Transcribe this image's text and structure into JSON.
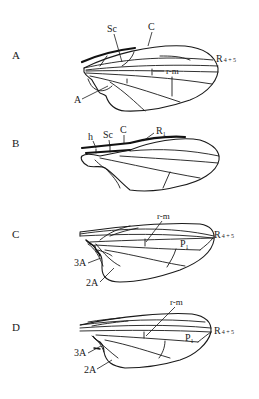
{
  "figure": {
    "panels": [
      {
        "id": "A",
        "letter": "A",
        "labels": {
          "sc": "Sc",
          "c": "C",
          "r45_main": "R",
          "r45_sub": "4 + 5",
          "rm": "r-m",
          "a": "A"
        }
      },
      {
        "id": "B",
        "letter": "B",
        "labels": {
          "h": "h",
          "sc": "Sc",
          "c": "C",
          "r1_main": "R",
          "r1_sub": "1"
        }
      },
      {
        "id": "C",
        "letter": "C",
        "labels": {
          "rm": "r-m",
          "r45_main": "R",
          "r45_sub": "4 + 5",
          "p1_main": "P",
          "p1_sub": "1",
          "a3": "3A",
          "a2": "2A"
        }
      },
      {
        "id": "D",
        "letter": "D",
        "labels": {
          "rm": "r-m",
          "r45_main": "R",
          "r45_sub": "4 + 5",
          "p1_main": "P",
          "p1_sub": "1",
          "a3": "3A",
          "a2": "2A"
        }
      }
    ]
  }
}
